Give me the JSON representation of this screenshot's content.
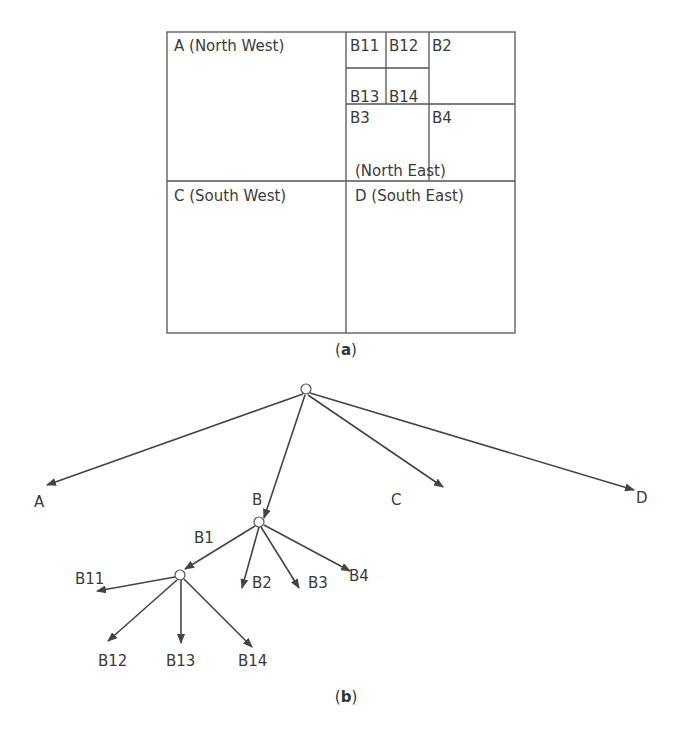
{
  "figure_a": {
    "caption_open": "(",
    "caption_letter": "a",
    "caption_close": ")",
    "quadrants": {
      "nw": "A (North West)",
      "ne": "(North East)",
      "sw": "C (South West)",
      "se": "D (South East)"
    },
    "subcells": {
      "b11": "B11",
      "b12": "B12",
      "b13": "B13",
      "b14": "B14",
      "b2": "B2",
      "b3": "B3",
      "b4": "B4"
    }
  },
  "figure_b": {
    "caption_open": "(",
    "caption_letter": "b",
    "caption_close": ")",
    "nodes": {
      "a": "A",
      "b": "B",
      "c": "C",
      "d": "D",
      "b1": "B1",
      "b2": "B2",
      "b3": "B3",
      "b4": "B4",
      "b11": "B11",
      "b12": "B12",
      "b13": "B13",
      "b14": "B14"
    }
  }
}
